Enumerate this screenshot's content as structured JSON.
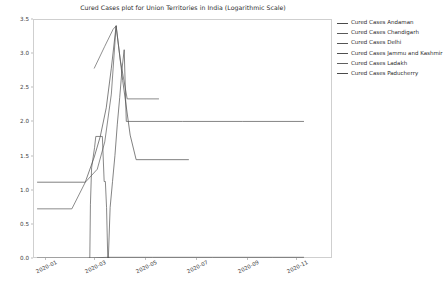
{
  "chart_data": {
    "type": "line",
    "title": "Cured Cases plot for Union Territories in India (Logarithmic Scale)",
    "xlabel": "",
    "ylabel": "",
    "scale": "logarithmic",
    "grid": false,
    "legend_position": "right",
    "xlim": [
      "2019-12-15",
      "2020-12-15"
    ],
    "ylim": [
      0.0,
      3.5
    ],
    "yticks": [
      "0.0",
      "0.5",
      "1.0",
      "1.5",
      "2.0",
      "2.5",
      "3.0",
      "3.5"
    ],
    "ytick_values": [
      0.0,
      0.5,
      1.0,
      1.5,
      2.0,
      2.5,
      3.0,
      3.5
    ],
    "xticks": [
      "2020-01",
      "2020-03",
      "2020-05",
      "2020-07",
      "2020-09",
      "2020-11"
    ],
    "xtick_values": [
      0.04,
      0.205,
      0.375,
      0.545,
      0.715,
      0.88
    ],
    "series": [
      {
        "name": "Cured Cases Andaman",
        "color": "#4a4a4a",
        "points": [
          [
            0.015,
            1.11
          ],
          [
            0.175,
            1.11
          ],
          [
            0.178,
            1.15
          ],
          [
            0.205,
            1.48
          ],
          [
            0.225,
            1.78
          ],
          [
            0.245,
            2.2
          ],
          [
            0.262,
            2.78
          ],
          [
            0.278,
            3.4
          ],
          [
            0.3,
            2.6
          ],
          [
            0.325,
            1.8
          ],
          [
            0.345,
            1.44
          ],
          [
            0.52,
            1.44
          ]
        ]
      },
      {
        "name": "Cured Cases Chandigarh",
        "color": "#5a5a5a",
        "points": [
          [
            0.015,
            0.72
          ],
          [
            0.13,
            0.72
          ],
          [
            0.175,
            1.11
          ],
          [
            0.215,
            1.3
          ],
          [
            0.24,
            1.7
          ],
          [
            0.262,
            2.4
          ],
          [
            0.278,
            3.4
          ],
          [
            0.292,
            2.9
          ],
          [
            0.315,
            2.33
          ],
          [
            0.42,
            2.33
          ]
        ]
      },
      {
        "name": "Cured Cases Delhi",
        "color": "#555555",
        "points": [
          [
            0.19,
            0.0
          ],
          [
            0.192,
            0.78
          ],
          [
            0.196,
            1.32
          ],
          [
            0.2,
            1.44
          ],
          [
            0.206,
            1.62
          ],
          [
            0.21,
            1.78
          ],
          [
            0.232,
            1.78
          ],
          [
            0.238,
            1.12
          ],
          [
            0.242,
            1.12
          ],
          [
            0.246,
            0.74
          ],
          [
            0.25,
            0.0
          ],
          [
            0.255,
            0.0
          ]
        ]
      },
      {
        "name": "Cured Cases Jammu and Kashmir",
        "color": "#4f4f4f",
        "points": [
          [
            0.252,
            0.0
          ],
          [
            0.258,
            0.74
          ],
          [
            0.266,
            1.12
          ],
          [
            0.274,
            1.5
          ],
          [
            0.282,
            1.96
          ],
          [
            0.29,
            2.35
          ],
          [
            0.298,
            2.78
          ],
          [
            0.305,
            3.05
          ],
          [
            0.312,
            2.0
          ],
          [
            0.5,
            2.0
          ],
          [
            0.7,
            2.0
          ],
          [
            0.905,
            2.0
          ]
        ]
      },
      {
        "name": "Cured Cases Ladakh",
        "color": "#606060",
        "points": [
          [
            0.205,
            2.78
          ],
          [
            0.24,
            3.1
          ],
          [
            0.268,
            3.35
          ],
          [
            0.278,
            3.4
          ]
        ]
      },
      {
        "name": "Cured Cases Paducherry",
        "color": "#4a4a4a",
        "points": [
          [
            0.015,
            0.0
          ],
          [
            0.18,
            0.0
          ],
          [
            0.252,
            0.01
          ],
          [
            0.4,
            0.01
          ],
          [
            0.6,
            0.01
          ],
          [
            0.8,
            0.01
          ],
          [
            0.905,
            0.01
          ]
        ]
      }
    ],
    "legend_entries": [
      "Cured Cases Andaman",
      "Cured Cases Chandigarh",
      "Cured Cases Delhi",
      "Cured Cases Jammu and Kashmir",
      "Cured Cases Ladakh",
      "Cured Cases Paducherry"
    ]
  }
}
